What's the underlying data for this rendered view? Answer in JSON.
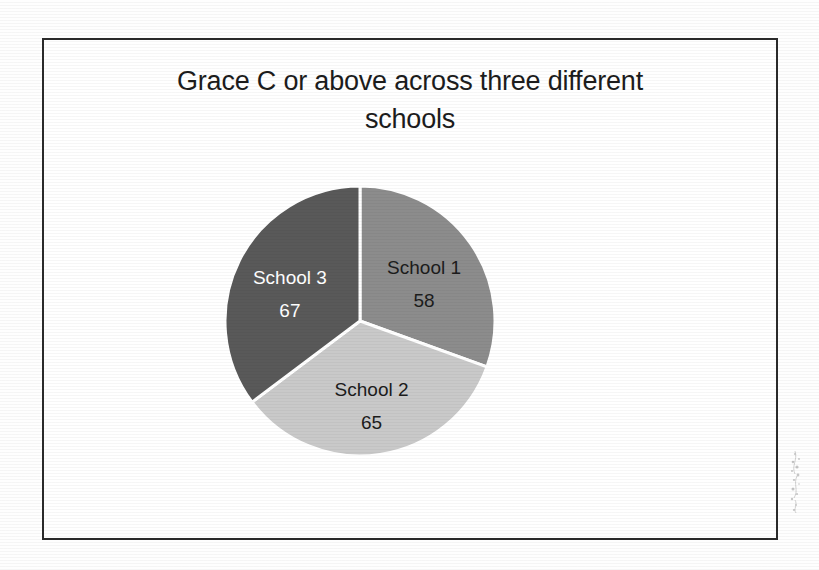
{
  "page": {
    "background_color": "#ffffff",
    "frame_color": "#2b2b2b"
  },
  "chart_data": {
    "type": "pie",
    "title": "Grace C or above across three different\nschools",
    "title_line_1": "Grace C or above across three different",
    "title_line_2": "schools",
    "xlabel": "",
    "ylabel": "",
    "legend": "none",
    "grid": false,
    "total": 190,
    "categories": [
      "School 1",
      "School 2",
      "School 3"
    ],
    "values": [
      58,
      65,
      67
    ],
    "labels": [
      "School 1",
      "School 2",
      "School 3"
    ],
    "value_labels": [
      "58",
      "65",
      "67"
    ],
    "colors": [
      "#8c8c8c",
      "#c9c9c9",
      "#595959"
    ],
    "label_colors": [
      "#1c1c1c",
      "#1c1c1c",
      "#ffffff"
    ],
    "start_angle_deg": 0,
    "direction": "clockwise",
    "separator_color": "#ffffff",
    "slices": [
      {
        "name": "School 1",
        "value": 58,
        "percent": 30.5,
        "angle_deg": 109.9,
        "color": "#8c8c8c",
        "label_color": "#1c1c1c"
      },
      {
        "name": "School 2",
        "value": 65,
        "percent": 34.2,
        "angle_deg": 123.2,
        "color": "#c9c9c9",
        "label_color": "#1c1c1c"
      },
      {
        "name": "School 3",
        "value": 67,
        "percent": 35.3,
        "angle_deg": 126.9,
        "color": "#595959",
        "label_color": "#ffffff"
      }
    ]
  }
}
